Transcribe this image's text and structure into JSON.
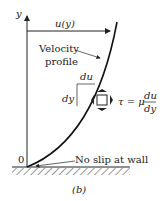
{
  "labels": {
    "y_axis": "y",
    "u_of_y": "u(y)",
    "velocity_profile_line1": "Velocity",
    "velocity_profile_line2": "profile",
    "du": "du",
    "dy": "dy",
    "tau_lhs": "τ = μ",
    "tau_num": "du",
    "tau_den": "dy",
    "origin": "0",
    "no_slip": "No slip at wall",
    "caption": "(b)"
  },
  "colors": {
    "ink": "#222222"
  }
}
